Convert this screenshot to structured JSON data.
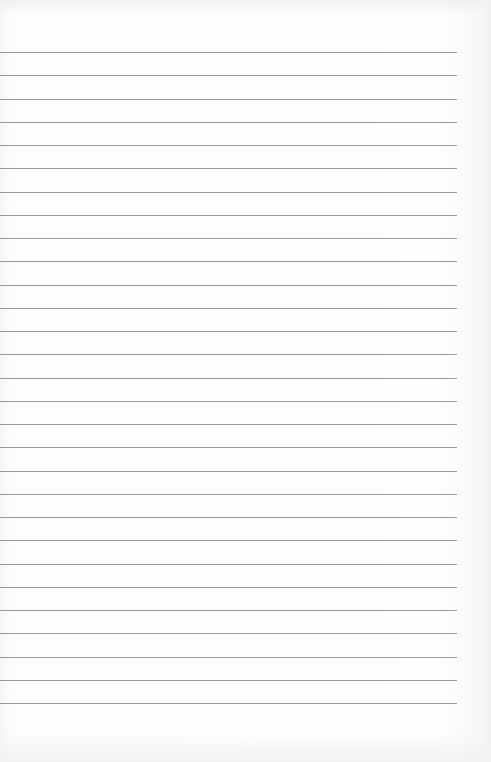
{
  "page": {
    "kind": "lined-paper",
    "background_color": "#fdfdfd",
    "rule_color": "#9a9a9a"
  },
  "rules": {
    "count": 29,
    "first_y": 52,
    "last_y": 703,
    "left_x": 0,
    "right_x": 457
  }
}
